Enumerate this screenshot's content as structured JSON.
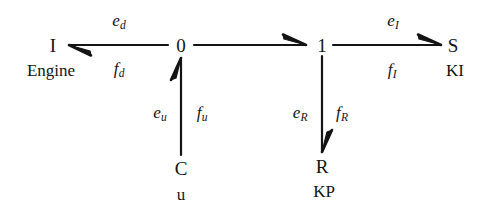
{
  "diagram": {
    "kind": "bond-graph",
    "title": "",
    "background_color": "#ffffff",
    "stroke_color": "#141414",
    "elements": {
      "inertia": {
        "symbol": "I",
        "sublabel": "Engine"
      },
      "junction_zero": {
        "symbol": "0"
      },
      "junction_one": {
        "symbol": "1"
      },
      "source": {
        "symbol": "S",
        "sublabel": "KI"
      },
      "capacitance": {
        "symbol": "C",
        "sublabel": "u"
      },
      "resistance": {
        "symbol": "R",
        "sublabel": "KP"
      }
    },
    "bonds": {
      "zero_to_inertia": {
        "effort": "e",
        "effort_sub": "d",
        "flow": "f",
        "flow_sub": "d",
        "direction": "left"
      },
      "zero_to_one": {
        "effort": "",
        "effort_sub": "",
        "flow": "",
        "flow_sub": "",
        "direction": "right"
      },
      "one_to_source": {
        "effort": "e",
        "effort_sub": "I",
        "flow": "f",
        "flow_sub": "I",
        "direction": "right"
      },
      "capacitance_to_zero": {
        "effort": "e",
        "effort_sub": "u",
        "flow": "f",
        "flow_sub": "u",
        "direction": "up"
      },
      "one_to_resistance": {
        "effort": "e",
        "effort_sub": "R",
        "flow": "f",
        "flow_sub": "R",
        "direction": "down"
      }
    }
  }
}
